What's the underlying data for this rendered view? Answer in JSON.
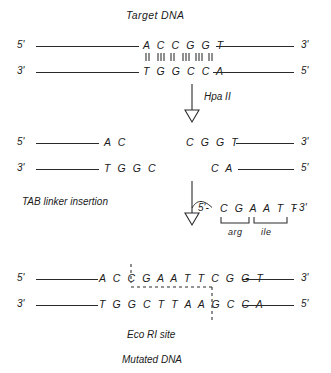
{
  "figure": {
    "title_top": "Target DNA",
    "title_bottom": "Mutated DNA",
    "site_caption": "Eco RI site"
  },
  "steps": [
    {
      "label": "Hpa II",
      "name": "hpa-ii-digestion"
    },
    {
      "label": "TAB linker insertion",
      "name": "tab-linker-insertion"
    }
  ],
  "ends": {
    "five_prime": "5'",
    "three_prime": "3'"
  },
  "target_dna": {
    "top_strand_left_end": "5'",
    "top_strand_right_end": "3'",
    "bottom_strand_left_end": "3'",
    "bottom_strand_right_end": "5'",
    "top_sequence": "A C C G G T",
    "bottom_sequence": "T G G C C A",
    "base_pair_count": 6
  },
  "fragments": {
    "left": {
      "top_end": "5'",
      "bottom_end": "3'",
      "top_sequence": "A C",
      "bottom_sequence": "T G G C"
    },
    "right": {
      "top_end": "3'",
      "bottom_end": "5'",
      "top_sequence": "C G G T",
      "bottom_sequence": "C A"
    }
  },
  "linker": {
    "five_prime": "5'-",
    "sequence": "C G A A T T",
    "three_prime": "- 3'",
    "codons": [
      {
        "label": "arg",
        "bases": "CGA"
      },
      {
        "label": "ile",
        "bases": "ATT"
      }
    ]
  },
  "mutated_dna": {
    "top_strand_left_end": "5'",
    "top_strand_right_end": "3'",
    "bottom_strand_left_end": "3'",
    "bottom_strand_right_end": "5'",
    "top_sequence": "A C C G A A T T C G G T",
    "bottom_sequence": "T G G C T T A A G C C A"
  },
  "colors": {
    "ink": "#1a1a1a",
    "line": "#2a2a2a",
    "background": "#ffffff"
  }
}
